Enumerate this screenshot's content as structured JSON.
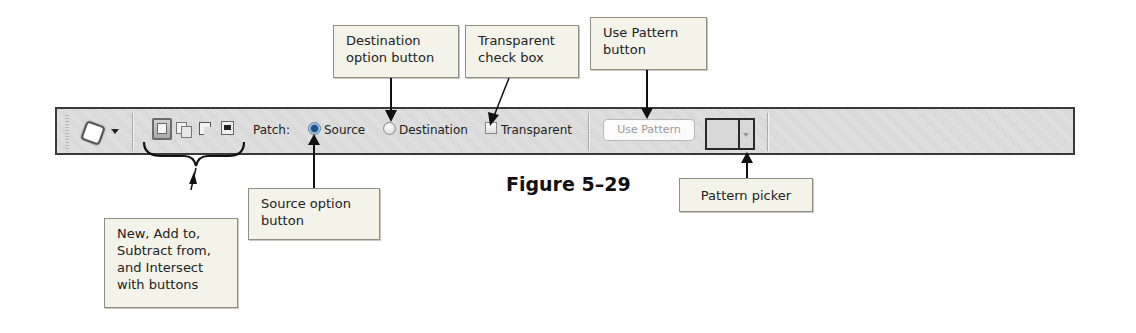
{
  "figure": {
    "label": "Figure 5–29"
  },
  "toolbar": {
    "tool_icon": "patch-tool-icon",
    "mode_buttons": [
      {
        "name": "new-selection",
        "icon": "new-selection-icon",
        "active": true
      },
      {
        "name": "add-to-selection",
        "icon": "add-to-selection-icon",
        "active": false
      },
      {
        "name": "subtract-from-selection",
        "icon": "subtract-from-selection-icon",
        "active": false
      },
      {
        "name": "intersect-with-selection",
        "icon": "intersect-with-selection-icon",
        "active": false
      }
    ],
    "patch_label": "Patch:",
    "source_label": "Source",
    "source_checked": true,
    "destination_label": "Destination",
    "destination_checked": false,
    "transparent_label": "Transparent",
    "transparent_checked": false,
    "use_pattern_label": "Use Pattern"
  },
  "callouts": {
    "destination": "Destination option button",
    "transparent": "Transparent check box",
    "use_pattern": "Use Pattern button",
    "mode_buttons": "New, Add to, Subtract from, and Intersect with buttons",
    "source": "Source option button",
    "pattern_picker": "Pattern picker"
  },
  "colors": {
    "toolbar_bg": "#dcdcdc",
    "callout_bg": "#f3f3e9",
    "radio_selected": "#1d4f8c"
  }
}
